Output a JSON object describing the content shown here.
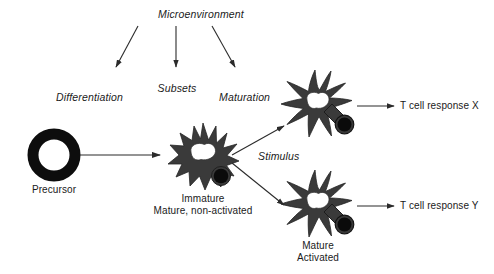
{
  "figure": {
    "title_label": "Microenvironment",
    "background_color": "#ffffff",
    "cell_body_color": "#3a3a3a",
    "outline_color": "#111111",
    "text_color": "#1a1a1a",
    "width": 494,
    "height": 274
  },
  "process_labels": {
    "microenvironment": "Microenvironment",
    "differentiation": "Differentiation",
    "subsets": "Subsets",
    "maturation": "Maturation",
    "stimulus": "Stimulus"
  },
  "cells": {
    "precursor": {
      "label": "Precursor",
      "shape": "ring"
    },
    "immature": {
      "label_line1": "Immature",
      "label_line2": "Mature, non-activated",
      "shape": "spiky-dendritic-cell"
    },
    "mature_top": {
      "label_line1": "",
      "label_line2": "",
      "shape": "dendritic-cell"
    },
    "mature_bottom": {
      "label_line1": "Mature",
      "label_line2": "Activated",
      "shape": "dendritic-cell"
    }
  },
  "outcomes": {
    "response_x": "T cell response X",
    "response_y": "T cell response Y"
  }
}
